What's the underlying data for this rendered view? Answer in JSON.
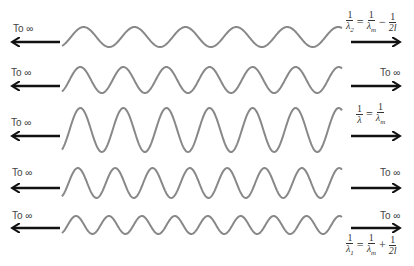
{
  "diagram": {
    "wave_color": "#888888",
    "arrow_color": "#111111",
    "rows": [
      {
        "id": "row-1",
        "left_label": "To ∞",
        "right_label": "",
        "wave": {
          "x_start": 62,
          "x_end": 342,
          "center_y": 37,
          "amplitude": 10,
          "periods": 5.5,
          "phase": "rise"
        },
        "arrow_y": 42,
        "formula": {
          "lhs_num": "1",
          "lhs_den": "λ",
          "lhs_sub": "2",
          "op1": "=",
          "t1_num": "1",
          "t1_den": "λ",
          "t1_sub": "m",
          "op2": "−",
          "t2_num": "1",
          "t2_den": "2l"
        }
      },
      {
        "id": "row-2",
        "left_label": "To ∞",
        "right_label": "To ∞",
        "wave": {
          "x_start": 62,
          "x_end": 342,
          "center_y": 80,
          "amplitude": 13,
          "periods": 6.5,
          "phase": "rise"
        },
        "arrow_y": 86
      },
      {
        "id": "row-3",
        "left_label": "To ∞",
        "right_label": "",
        "wave": {
          "x_start": 62,
          "x_end": 342,
          "center_y": 130,
          "amplitude": 22,
          "periods": 6.5,
          "phase": "rise"
        },
        "arrow_y": 136,
        "formula": {
          "lhs_num": "1",
          "lhs_den": "λ",
          "lhs_sub": "",
          "op1": "=",
          "t1_num": "1",
          "t1_den": "λ",
          "t1_sub": "m"
        }
      },
      {
        "id": "row-4",
        "left_label": "To ∞",
        "right_label": "To ∞",
        "wave": {
          "x_start": 62,
          "x_end": 342,
          "center_y": 183,
          "amplitude": 15,
          "periods": 7.5,
          "phase": "rise"
        },
        "arrow_y": 188
      },
      {
        "id": "row-5",
        "left_label": "To ∞",
        "right_label": "To ∞",
        "wave": {
          "x_start": 62,
          "x_end": 342,
          "center_y": 225,
          "amplitude": 9,
          "periods": 8.5,
          "phase": "rise"
        },
        "arrow_y": 228,
        "formula": {
          "lhs_num": "1",
          "lhs_den": "λ",
          "lhs_sub": "1",
          "op1": "=",
          "t1_num": "1",
          "t1_den": "λ",
          "t1_sub": "m",
          "op2": "+",
          "t2_num": "1",
          "t2_den": "2l"
        }
      }
    ]
  }
}
